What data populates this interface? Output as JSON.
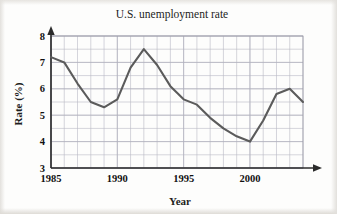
{
  "chart_data": {
    "type": "line",
    "title": "U.S. unemployment rate",
    "xlabel": "Year",
    "ylabel": "Rate (%)",
    "xlim": [
      1985,
      2004
    ],
    "ylim": [
      3,
      8
    ],
    "x_ticks": [
      1985,
      1990,
      1995,
      2000
    ],
    "x_tick_labels": [
      "1985",
      "1990",
      "1995",
      "2000"
    ],
    "y_ticks": [
      3,
      4,
      5,
      6,
      7,
      8
    ],
    "y_tick_labels": [
      "3",
      "4",
      "5",
      "6",
      "7",
      "8"
    ],
    "x_minor_step": 1,
    "y_minor_step": 0.5,
    "grid": true,
    "legend": "none",
    "line_color": "#5b5b5b",
    "grid_color": "#b9b9c4",
    "axis_color": "#2b2b2b",
    "x": [
      1985,
      1986,
      1987,
      1988,
      1989,
      1990,
      1991,
      1992,
      1993,
      1994,
      1995,
      1996,
      1997,
      1998,
      1999,
      2000,
      2001,
      2002,
      2003,
      2004
    ],
    "values": [
      7.2,
      7.0,
      6.2,
      5.5,
      5.3,
      5.6,
      6.8,
      7.5,
      6.9,
      6.1,
      5.6,
      5.4,
      4.9,
      4.5,
      4.2,
      4.0,
      4.8,
      5.8,
      6.0,
      5.5
    ],
    "series": [
      {
        "name": "U.S. unemployment rate",
        "values": [
          7.2,
          7.0,
          6.2,
          5.5,
          5.3,
          5.6,
          6.8,
          7.5,
          6.9,
          6.1,
          5.6,
          5.4,
          4.9,
          4.5,
          4.2,
          4.0,
          4.8,
          5.8,
          6.0,
          5.5
        ]
      }
    ],
    "annotations": {
      "peak": {
        "year": 1992,
        "value": 7.5
      },
      "trough": {
        "year": 2000,
        "value": 4.0
      }
    }
  }
}
